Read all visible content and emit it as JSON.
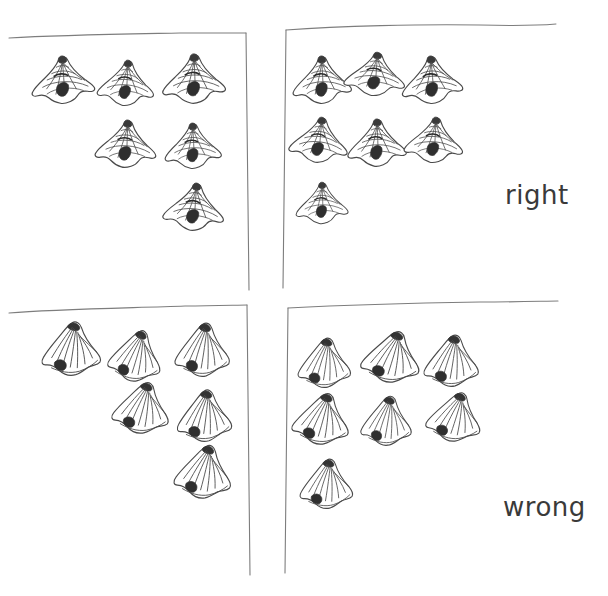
{
  "figure": {
    "type": "hand-drawn-sketch",
    "background_color": "#ffffff",
    "ink_color": "#4a4a4a",
    "width": 608,
    "height": 596
  },
  "labels": {
    "right": "right",
    "wrong": "wrong"
  },
  "panels": [
    {
      "id": "top-left",
      "row": "right",
      "column": "left",
      "style": "grid-mesh",
      "shape_count": 6,
      "frame": {
        "top": true,
        "right": true,
        "left": false,
        "bottom": false
      },
      "shapes": [
        {
          "cx": 63,
          "cy": 82,
          "w": 58,
          "h": 48,
          "rot": -4
        },
        {
          "cx": 126,
          "cy": 85,
          "w": 52,
          "h": 46,
          "rot": 3
        },
        {
          "cx": 194,
          "cy": 81,
          "w": 58,
          "h": 50,
          "rot": -2
        },
        {
          "cx": 126,
          "cy": 146,
          "w": 56,
          "h": 48,
          "rot": 2
        },
        {
          "cx": 193,
          "cy": 148,
          "w": 52,
          "h": 46,
          "rot": -3
        },
        {
          "cx": 194,
          "cy": 209,
          "w": 56,
          "h": 48,
          "rot": 4
        }
      ]
    },
    {
      "id": "top-right",
      "row": "right",
      "column": "right",
      "style": "grid-mesh",
      "shape_count": 7,
      "frame": {
        "top": true,
        "right": false,
        "left": true,
        "bottom": false
      },
      "shapes": [
        {
          "cx": 322,
          "cy": 82,
          "w": 54,
          "h": 48,
          "rot": -3
        },
        {
          "cx": 375,
          "cy": 76,
          "w": 56,
          "h": 44,
          "rot": 4
        },
        {
          "cx": 432,
          "cy": 82,
          "w": 56,
          "h": 48,
          "rot": -5
        },
        {
          "cx": 319,
          "cy": 142,
          "w": 54,
          "h": 46,
          "rot": 5
        },
        {
          "cx": 377,
          "cy": 145,
          "w": 54,
          "h": 48,
          "rot": -2
        },
        {
          "cx": 434,
          "cy": 142,
          "w": 54,
          "h": 46,
          "rot": 3
        },
        {
          "cx": 322,
          "cy": 205,
          "w": 48,
          "h": 42,
          "rot": -2
        }
      ]
    },
    {
      "id": "bottom-left",
      "row": "wrong",
      "column": "left",
      "style": "radial-swirl",
      "shape_count": 6,
      "frame": {
        "top": true,
        "right": true,
        "left": false,
        "bottom": false
      },
      "shapes": [
        {
          "cx": 72,
          "cy": 350,
          "w": 58,
          "h": 52,
          "rot": -4
        },
        {
          "cx": 136,
          "cy": 357,
          "w": 52,
          "h": 50,
          "rot": 5
        },
        {
          "cx": 203,
          "cy": 351,
          "w": 54,
          "h": 52,
          "rot": -3
        },
        {
          "cx": 142,
          "cy": 409,
          "w": 56,
          "h": 50,
          "rot": 3
        },
        {
          "cx": 205,
          "cy": 417,
          "w": 54,
          "h": 50,
          "rot": -5
        },
        {
          "cx": 204,
          "cy": 473,
          "w": 56,
          "h": 52,
          "rot": 2
        }
      ]
    },
    {
      "id": "bottom-right",
      "row": "wrong",
      "column": "right",
      "style": "radial-swirl",
      "shape_count": 7,
      "frame": {
        "top": true,
        "right": false,
        "left": true,
        "bottom": false
      },
      "shapes": [
        {
          "cx": 325,
          "cy": 364,
          "w": 52,
          "h": 48,
          "rot": -4
        },
        {
          "cx": 392,
          "cy": 358,
          "w": 58,
          "h": 50,
          "rot": 4
        },
        {
          "cx": 452,
          "cy": 362,
          "w": 54,
          "h": 50,
          "rot": -3
        },
        {
          "cx": 322,
          "cy": 420,
          "w": 56,
          "h": 50,
          "rot": 3
        },
        {
          "cx": 387,
          "cy": 422,
          "w": 50,
          "h": 48,
          "rot": -2
        },
        {
          "cx": 455,
          "cy": 418,
          "w": 54,
          "h": 48,
          "rot": 5
        },
        {
          "cx": 327,
          "cy": 485,
          "w": 52,
          "h": 48,
          "rot": -4
        }
      ]
    }
  ],
  "frame_lines": [
    {
      "name": "top-left-horizontal",
      "x1": 9,
      "y1": 38,
      "x2": 246,
      "y2": 33
    },
    {
      "name": "top-left-vertical",
      "x1": 246,
      "y1": 33,
      "x2": 249,
      "y2": 290
    },
    {
      "name": "top-right-horizontal",
      "x1": 286,
      "y1": 30,
      "x2": 556,
      "y2": 24
    },
    {
      "name": "top-right-vertical",
      "x1": 286,
      "y1": 30,
      "x2": 283,
      "y2": 288
    },
    {
      "name": "mid-left-horizontal",
      "x1": 9,
      "y1": 312,
      "x2": 247,
      "y2": 305
    },
    {
      "name": "mid-left-vertical",
      "x1": 247,
      "y1": 305,
      "x2": 250,
      "y2": 575
    },
    {
      "name": "mid-right-horizontal",
      "x1": 288,
      "y1": 308,
      "x2": 558,
      "y2": 301
    },
    {
      "name": "mid-right-vertical",
      "x1": 288,
      "y1": 308,
      "x2": 285,
      "y2": 573
    }
  ]
}
